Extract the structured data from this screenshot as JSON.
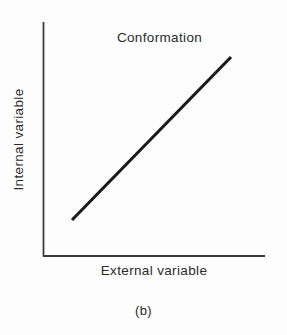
{
  "figure": {
    "caption": "(b)",
    "background_color": "#fdfdfd",
    "ink_color": "#2b2b2b"
  },
  "chart_data": {
    "type": "line",
    "title": "Conformation",
    "xlabel": "External variable",
    "ylabel": "Internal variable",
    "series": [
      {
        "name": "Conformation",
        "x": [
          0.13,
          0.85
        ],
        "y": [
          0.15,
          0.85
        ],
        "color": "#1a1a1a",
        "line_width": 3
      }
    ],
    "xlim": [
      0,
      1
    ],
    "ylim": [
      0,
      1
    ],
    "grid": false,
    "legend": false,
    "xticks": [],
    "yticks": [],
    "axis_color": "#3c3c3c",
    "axis_line_width": 1.6,
    "annotations": [
      {
        "text": "Conformation",
        "role": "plot-title",
        "position": "top-center"
      }
    ]
  },
  "axes_geometry": {
    "origin_x": 43,
    "origin_y": 256,
    "x_axis_end_x": 265,
    "y_axis_top_y": 22,
    "data_x1": 72,
    "data_y1": 220,
    "data_x2": 231,
    "data_y2": 57
  }
}
